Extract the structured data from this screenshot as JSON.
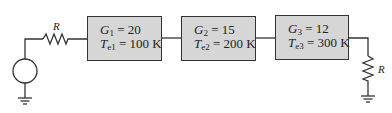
{
  "source_resistor": {
    "label": "R"
  },
  "load_resistor": {
    "label": "R"
  },
  "stages": [
    {
      "gain_symbol": "G",
      "gain_sub": "1",
      "gain_value": "= 20",
      "temp_symbol": "T",
      "temp_sub": "e1",
      "temp_value": "= 100 K"
    },
    {
      "gain_symbol": "G",
      "gain_sub": "2",
      "gain_value": "= 15",
      "temp_symbol": "T",
      "temp_sub": "e2",
      "temp_value": "= 200 K"
    },
    {
      "gain_symbol": "G",
      "gain_sub": "3",
      "gain_value": "= 12",
      "temp_symbol": "T",
      "temp_sub": "e3",
      "temp_value": "= 300 K"
    }
  ],
  "colors": {
    "box_fill": "#d6d6d6",
    "stroke": "#333333"
  }
}
